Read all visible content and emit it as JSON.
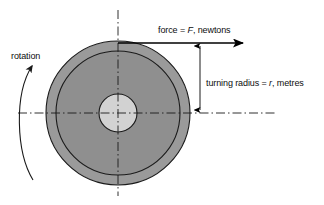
{
  "diagram": {
    "background_color": "#ffffff",
    "labels": {
      "force": {
        "prefix": "force = ",
        "symbol": "F",
        "suffix": ", newtons",
        "full_text": "force = F, newtons"
      },
      "turning_radius": {
        "prefix": "turning radius = ",
        "symbol": "r",
        "suffix": ", metres",
        "full_text": "turning radius = r, metres"
      },
      "rotation": {
        "full_text": "rotation"
      }
    },
    "wheel": {
      "center_x": 118,
      "center_y": 113,
      "outer_radius": 72,
      "inner_radius": 62,
      "hub_radius": 19,
      "outer_ring_color": "#9a9a9a",
      "inner_disc_color": "#8f8f8f",
      "hub_color": "#d2d2d2",
      "stroke_color": "#1a1a1a"
    },
    "force_arrow": {
      "from_x": 118,
      "from_y": 43,
      "to_x": 249,
      "to_y": 43,
      "color": "#000000"
    },
    "radius_dimension": {
      "x": 200,
      "top_y": 43,
      "bottom_y": 113,
      "color": "#000000"
    },
    "rotation_arc": {
      "direction": "counter-clockwise",
      "color": "#1a1a1a"
    },
    "centerlines": {
      "style": "dash-dot",
      "color": "#1a1a1a",
      "vertical": {
        "x": 118,
        "y1": 10,
        "y2": 196
      },
      "horizontal": {
        "y": 113,
        "x1": 18,
        "x2": 276
      }
    }
  }
}
